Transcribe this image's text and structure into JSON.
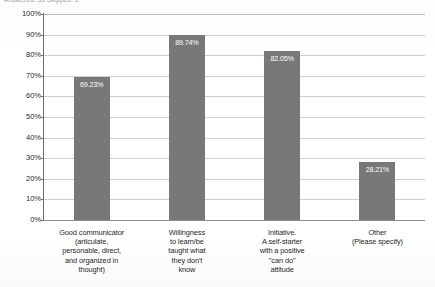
{
  "survey": {
    "meta_line": "Answered: 39   Skipped: 1"
  },
  "chart_data": {
    "type": "bar",
    "title": "",
    "xlabel": "",
    "ylabel": "",
    "ylim": [
      0,
      100
    ],
    "grid": true,
    "legend": "none",
    "orientation": "vertical",
    "bar_color": "#787878",
    "value_label_color": "#ffffff",
    "gridline_color": "#cfcfcf",
    "axis_color": "#6b6b6b",
    "categories": [
      "Good communicator\n(articulate,\npersonable, direct,\nand organized in\nthought)",
      "Willingness\nto learn/be\ntaught what\nthey don't\nknow",
      "Initiative.\nA self-starter\nwith a positive\n\"can do\"\nattitude",
      "Other\n(Please specify)"
    ],
    "values": [
      69.23,
      89.74,
      82.05,
      28.21
    ],
    "value_labels": [
      "69.23%",
      "89.74%",
      "82.05%",
      "28.21%"
    ],
    "y_ticks": [
      100,
      90,
      80,
      70,
      60,
      50,
      40,
      30,
      20,
      10,
      0
    ],
    "y_tick_labels": [
      "100%",
      "90%",
      "80%",
      "70%",
      "60%",
      "50%",
      "40%",
      "30%",
      "20%",
      "10%",
      "0%"
    ]
  }
}
